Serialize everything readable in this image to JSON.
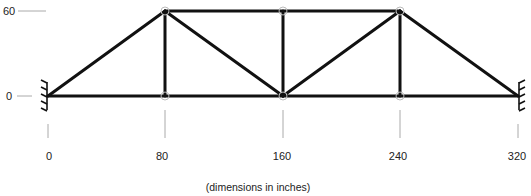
{
  "diagram": {
    "type": "pratt-truss",
    "units_caption": "(dimensions in inches)",
    "y_axis": {
      "ticks": [
        {
          "label": "60",
          "value": 60
        },
        {
          "label": "0",
          "value": 0
        }
      ]
    },
    "x_axis": {
      "ticks": [
        {
          "label": "0",
          "value": 0
        },
        {
          "label": "80",
          "value": 80
        },
        {
          "label": "160",
          "value": 160
        },
        {
          "label": "240",
          "value": 240
        },
        {
          "label": "320",
          "value": 320
        }
      ]
    },
    "nodes": [
      {
        "id": "A",
        "x": 0,
        "y": 0
      },
      {
        "id": "B",
        "x": 80,
        "y": 0
      },
      {
        "id": "C",
        "x": 160,
        "y": 0
      },
      {
        "id": "D",
        "x": 240,
        "y": 0
      },
      {
        "id": "E",
        "x": 320,
        "y": 0
      },
      {
        "id": "F",
        "x": 80,
        "y": 60
      },
      {
        "id": "G",
        "x": 160,
        "y": 60
      },
      {
        "id": "H",
        "x": 240,
        "y": 60
      }
    ],
    "members": [
      [
        "A",
        "B"
      ],
      [
        "B",
        "C"
      ],
      [
        "C",
        "D"
      ],
      [
        "D",
        "E"
      ],
      [
        "F",
        "G"
      ],
      [
        "G",
        "H"
      ],
      [
        "A",
        "F"
      ],
      [
        "H",
        "E"
      ],
      [
        "B",
        "F"
      ],
      [
        "C",
        "G"
      ],
      [
        "D",
        "H"
      ],
      [
        "F",
        "C"
      ],
      [
        "C",
        "H"
      ]
    ],
    "supports": [
      {
        "node": "A",
        "type": "fixed",
        "side": "left"
      },
      {
        "node": "E",
        "type": "fixed",
        "side": "right"
      }
    ],
    "colors": {
      "member": "#111111",
      "node_ring": "#bbbbbb",
      "tick": "#aaaaaa",
      "text": "#222222"
    }
  }
}
